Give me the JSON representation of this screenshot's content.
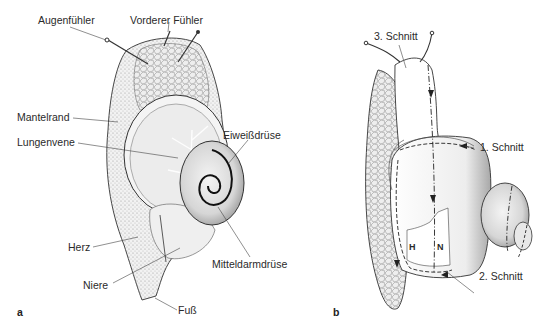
{
  "figure": {
    "panel_a": {
      "letter": "a",
      "labels": {
        "augenfuehler": "Augenfühler",
        "vorderer_fuehler": "Vorderer Fühler",
        "mantelrand": "Mantelrand",
        "lungenvene": "Lungenvene",
        "eiweissdruese": "Eiweißdrüse",
        "herz": "Herz",
        "niere": "Niere",
        "mitteldarmdruese": "Mitteldarmdrüse",
        "fuss": "Fuß"
      }
    },
    "panel_b": {
      "letter": "b",
      "labels": {
        "schnitt3": "3. Schnitt",
        "schnitt1": "1. Schnitt",
        "schnitt2": "2. Schnitt",
        "h": "H",
        "n": "N"
      }
    },
    "colors": {
      "line": "#333333",
      "shade": "#bdbdbd",
      "text": "#2a2a2a"
    }
  }
}
